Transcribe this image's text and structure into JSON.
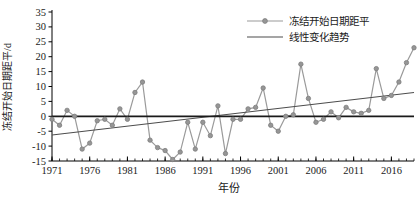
{
  "figure": {
    "y_axis_label": "冻结开始日期距平/d",
    "x_axis_label": "年份",
    "legend": [
      {
        "label": "冻结开始日期距平",
        "type": "line-marker",
        "color": "#9a9a9a"
      },
      {
        "label": "线性变化趋势",
        "type": "line",
        "color": "#4d4d4d"
      }
    ]
  },
  "chart_data": {
    "type": "line",
    "title": "",
    "xlabel": "年份",
    "ylabel": "冻结开始日期距平/d",
    "x": [
      1971,
      1972,
      1973,
      1974,
      1975,
      1976,
      1977,
      1978,
      1979,
      1980,
      1981,
      1982,
      1983,
      1984,
      1985,
      1986,
      1987,
      1988,
      1989,
      1990,
      1991,
      1992,
      1993,
      1994,
      1995,
      1996,
      1997,
      1998,
      1999,
      2000,
      2001,
      2002,
      2003,
      2004,
      2005,
      2006,
      2007,
      2008,
      2009,
      2010,
      2011,
      2012,
      2013,
      2014,
      2015,
      2016,
      2017,
      2018,
      2019
    ],
    "series": [
      {
        "name": "冻结开始日期距平",
        "values": [
          -1,
          -3,
          2,
          0,
          -11,
          -9,
          -1.5,
          -1,
          -3,
          2.5,
          -1,
          8,
          11.5,
          -8,
          -10.5,
          -11.5,
          -14.5,
          -12,
          -2,
          -11,
          -2,
          -6.5,
          3.5,
          -12.5,
          -1,
          -1,
          2.5,
          3,
          9.5,
          -3,
          -5,
          0,
          0.5,
          17.5,
          6,
          -2,
          -1,
          1.5,
          -0.5,
          3,
          1.5,
          1,
          2,
          16,
          6,
          7,
          11.5,
          18,
          23
        ]
      }
    ],
    "trend": {
      "name": "线性变化趋势",
      "start": {
        "x": 1971,
        "y": -6.3
      },
      "end": {
        "x": 2019,
        "y": 8
      }
    },
    "zero_line": true,
    "xlim": [
      1971,
      2019
    ],
    "ylim": [
      -15,
      35
    ],
    "ytick_step": 5,
    "xticks": [
      1971,
      1976,
      1981,
      1986,
      1991,
      1996,
      2001,
      2006,
      2011,
      2016
    ],
    "yticks": [
      -15,
      -10,
      -5,
      0,
      5,
      10,
      15,
      20,
      25,
      30,
      35
    ],
    "legend_position": "top-right",
    "grid": false,
    "colors": {
      "series": "#9a9a9a",
      "marker_fill": "#969696",
      "marker_edge": "#7d7d7d",
      "trend": "#4d4d4d",
      "zero": "#1a1a1a",
      "axis": "#000000",
      "text": "#1a1a1a"
    }
  }
}
